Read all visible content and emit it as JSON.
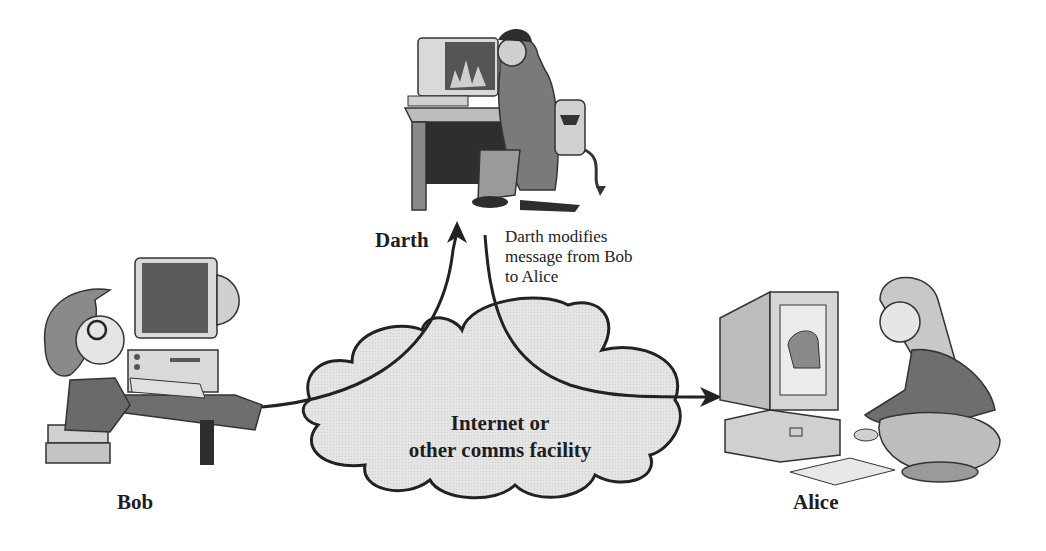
{
  "diagram": {
    "type": "man-in-the-middle message modification",
    "actors": [
      {
        "id": "bob",
        "label": "Bob",
        "role": "sender"
      },
      {
        "id": "darth",
        "label": "Darth",
        "role": "attacker"
      },
      {
        "id": "alice",
        "label": "Alice",
        "role": "receiver"
      }
    ],
    "network": {
      "label_line1": "Internet or",
      "label_line2": "other comms facility"
    },
    "annotation": {
      "line1": "Darth modifies",
      "line2": "message from Bob",
      "line3": "to Alice"
    },
    "flows": [
      {
        "from": "bob",
        "to": "darth",
        "via": "network"
      },
      {
        "from": "darth",
        "to": "alice",
        "via": "network"
      }
    ],
    "colors": {
      "line": "#222222",
      "cloud_fill": "#e2e2e2",
      "figure_dark": "#555555",
      "figure_mid": "#9a9a9a",
      "figure_light": "#d8d8d8"
    }
  }
}
